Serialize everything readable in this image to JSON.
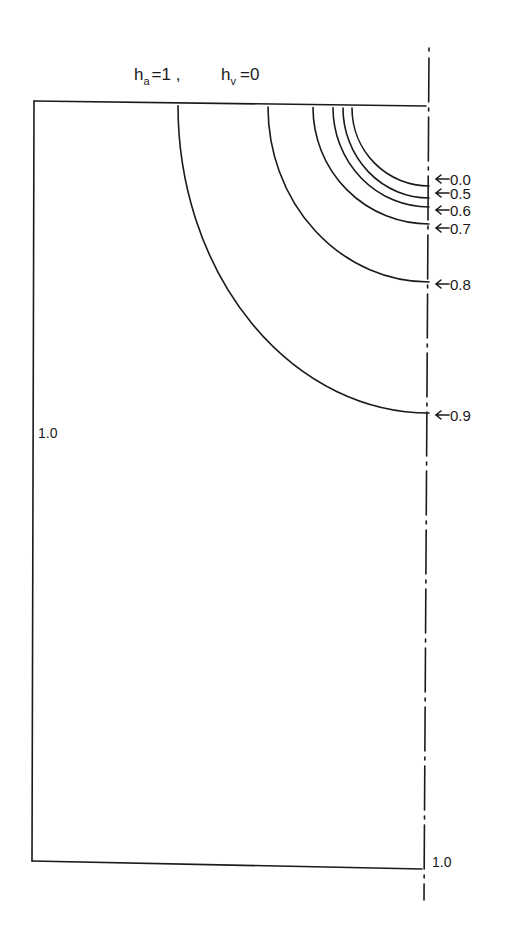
{
  "title": {
    "ha_symbol": "h",
    "ha_sub": "a",
    "ha_value": "=1 ,",
    "hv_symbol": "h",
    "hv_sub": "v",
    "hv_value": "=0"
  },
  "boundary_labels": {
    "left": "1.0",
    "bottom_right": "1.0"
  },
  "colors": {
    "ink": "#1a1a1a",
    "background": "#ffffff"
  },
  "geometry": {
    "top_y": 104,
    "left_x": 34,
    "axis_x": 430,
    "bottom_left_y": 861,
    "bottom_right_y": 869
  },
  "contours": [
    {
      "label": "0.0",
      "x_top": 352,
      "y_axis": 186,
      "label_y": 183
    },
    {
      "label": "0.5",
      "x_top": 343,
      "y_axis": 198,
      "label_y": 197
    },
    {
      "label": "0.6",
      "x_top": 333,
      "y_axis": 207,
      "label_y": 214
    },
    {
      "label": "0.7",
      "x_top": 313,
      "y_axis": 224,
      "label_y": 232
    },
    {
      "label": "0.8",
      "x_top": 268,
      "y_axis": 282,
      "label_y": 288
    },
    {
      "label": "0.9",
      "x_top": 178,
      "y_axis": 413,
      "label_y": 419
    }
  ]
}
